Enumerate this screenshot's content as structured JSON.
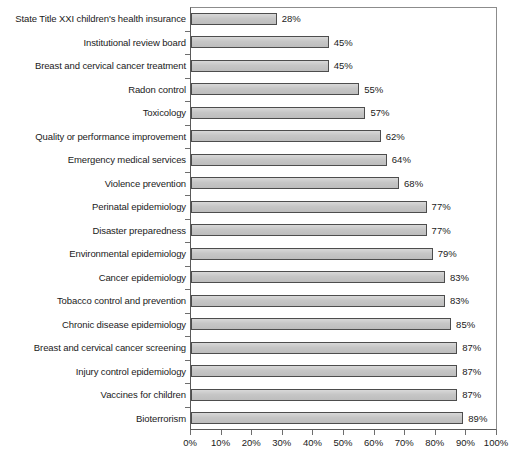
{
  "chart_data": {
    "type": "bar",
    "orientation": "horizontal",
    "title": "",
    "xlabel": "",
    "ylabel": "",
    "xlim": [
      0,
      100
    ],
    "xticks": [
      0,
      10,
      20,
      30,
      40,
      50,
      60,
      70,
      80,
      90,
      100
    ],
    "xtick_labels": [
      "0%",
      "10%",
      "20%",
      "30%",
      "40%",
      "50%",
      "60%",
      "70%",
      "80%",
      "90%",
      "100%"
    ],
    "grid": false,
    "legend": null,
    "value_suffix": "%",
    "categories": [
      "State Title XXI children's health insurance",
      "Institutional review board",
      "Breast and cervical cancer treatment",
      "Radon control",
      "Toxicology",
      "Quality or performance improvement",
      "Emergency medical services",
      "Violence prevention",
      "Perinatal epidemiology",
      "Disaster preparedness",
      "Environmental epidemiology",
      "Cancer epidemiology",
      "Tobacco control and prevention",
      "Chronic disease epidemiology",
      "Breast and cervical cancer screening",
      "Injury control epidemiology",
      "Vaccines for children",
      "Bioterrorism"
    ],
    "values": [
      28,
      45,
      45,
      55,
      57,
      62,
      64,
      68,
      77,
      77,
      79,
      83,
      83,
      85,
      87,
      87,
      87,
      89
    ],
    "value_labels": [
      "28%",
      "45%",
      "45%",
      "55%",
      "57%",
      "62%",
      "64%",
      "68%",
      "77%",
      "77%",
      "79%",
      "83%",
      "83%",
      "85%",
      "87%",
      "87%",
      "87%",
      "89%"
    ],
    "colors": {
      "bar_fill": "#c9c9c9",
      "bar_border": "#4d4d4d",
      "axis": "#5a5a5a",
      "text": "#1a1a1a",
      "background": "#ffffff"
    }
  }
}
